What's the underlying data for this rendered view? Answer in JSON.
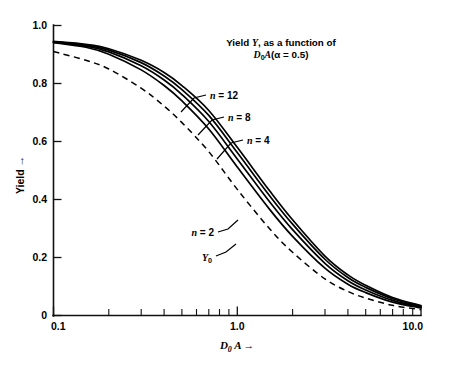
{
  "chart_data": {
    "type": "line",
    "title_line1": "Yield Y, as a function of",
    "title_line2": "D₀A(α = 0.5)",
    "title_line1_parts": {
      "lead": "Yield ",
      "italic": "Y",
      "tail": ", as a function of"
    },
    "title_line2_parts": {
      "italic_d": "D",
      "sub": "0",
      "italic_a": "A",
      "paren_open": "(",
      "alpha": "α",
      "equals": " = ",
      "alpha_value": "0.5",
      "paren_close": ")"
    },
    "xlabel": "D₀ A →",
    "xlabel_parts": {
      "italic_d": "D",
      "sub": "0",
      "italic_a": "A",
      "arrow": "→"
    },
    "ylabel": "Yield →",
    "xscale": "log",
    "yscale": "linear",
    "xlim": [
      0.1,
      10.0
    ],
    "ylim": [
      0.0,
      1.0
    ],
    "grid": false,
    "legend": "inline-labels",
    "x_tick_labels": [
      "0.1",
      "1.0",
      "10.0"
    ],
    "x_tick_values": [
      0.1,
      1.0,
      10.0
    ],
    "x_minor_ticks": [
      0.2,
      0.3,
      0.4,
      0.5,
      0.6,
      0.7,
      0.8,
      0.9,
      2.0,
      3.0,
      4.0,
      5.0,
      6.0,
      7.0,
      8.0,
      9.0
    ],
    "y_tick_labels": [
      "0",
      "0.2",
      "0.4",
      "0.6",
      "0.8",
      "1.0"
    ],
    "y_tick_values": [
      0,
      0.2,
      0.4,
      0.6,
      0.8,
      1.0
    ],
    "x": [
      0.1,
      0.15,
      0.2,
      0.3,
      0.4,
      0.5,
      0.7,
      1.0,
      1.5,
      2.0,
      3.0,
      4.0,
      5.0,
      7.0,
      10.0
    ],
    "series": [
      {
        "name": "n = 12",
        "label": "n = 12",
        "label_parts": {
          "italic": "n",
          "rest": " = 12"
        },
        "style": "solid",
        "values": [
          0.945,
          0.935,
          0.92,
          0.88,
          0.838,
          0.793,
          0.707,
          0.58,
          0.43,
          0.33,
          0.205,
          0.14,
          0.104,
          0.062,
          0.034
        ]
      },
      {
        "name": "n = 8",
        "label": "n = 8",
        "label_parts": {
          "italic": "n",
          "rest": " = 8"
        },
        "style": "solid",
        "values": [
          0.944,
          0.932,
          0.915,
          0.872,
          0.826,
          0.779,
          0.69,
          0.562,
          0.413,
          0.315,
          0.194,
          0.131,
          0.097,
          0.058,
          0.032
        ]
      },
      {
        "name": "n = 4",
        "label": "n = 4",
        "label_parts": {
          "italic": "n",
          "rest": " = 4"
        },
        "style": "solid",
        "values": [
          0.943,
          0.929,
          0.909,
          0.861,
          0.812,
          0.762,
          0.669,
          0.54,
          0.392,
          0.296,
          0.18,
          0.12,
          0.088,
          0.052,
          0.029
        ]
      },
      {
        "name": "n = 2",
        "label": "n = 2",
        "label_parts": {
          "italic": "n",
          "rest": " = 2"
        },
        "style": "solid",
        "values": [
          0.941,
          0.925,
          0.901,
          0.847,
          0.793,
          0.74,
          0.643,
          0.512,
          0.366,
          0.273,
          0.163,
          0.108,
          0.079,
          0.046,
          0.026
        ]
      },
      {
        "name": "Y0",
        "label": "Y₀",
        "label_parts": {
          "italic": "Y",
          "sub": "0"
        },
        "style": "dashed",
        "values": [
          0.91,
          0.88,
          0.85,
          0.784,
          0.722,
          0.665,
          0.565,
          0.435,
          0.299,
          0.218,
          0.126,
          0.083,
          0.06,
          0.035,
          0.02
        ]
      }
    ],
    "annotations": [
      {
        "text": "n = 12",
        "target_x": 0.58,
        "target_y": 0.7
      },
      {
        "text": "n = 8",
        "target_x": 0.85,
        "target_y": 0.6
      },
      {
        "text": "n = 4",
        "target_x": 1.05,
        "target_y": 0.51
      },
      {
        "text": "n = 2",
        "target_x": 1.15,
        "target_y": 0.42
      },
      {
        "text": "Y₀",
        "target_x": 1.05,
        "target_y": 0.3
      }
    ]
  },
  "colors": {
    "background": "#ffffff",
    "ink": "#000000",
    "axis": "#111111"
  }
}
